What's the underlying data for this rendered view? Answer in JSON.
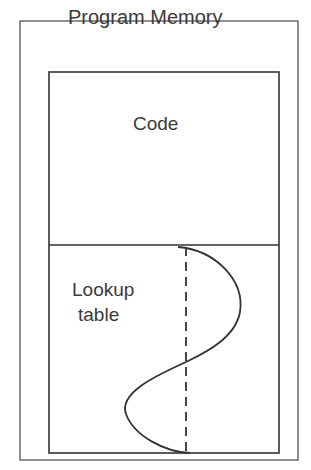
{
  "diagram": {
    "title": "Program Memory",
    "sections": [
      {
        "label": "Code"
      },
      {
        "label_line1": "Lookup",
        "label_line2": "table"
      }
    ],
    "colors": {
      "stroke": "#3a3a3a",
      "background": "#ffffff",
      "text": "#3a3a3a"
    }
  }
}
